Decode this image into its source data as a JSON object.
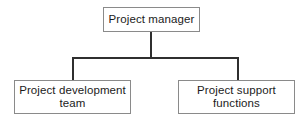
{
  "diagram": {
    "type": "org-chart",
    "orientation": "top-down",
    "background_color": "#ffffff",
    "box_border_color": "#8a8a8a",
    "connector_color": "#2f2f2f",
    "text_color": "#1b1b1b",
    "nodes": [
      {
        "id": "root",
        "label": "Project manager",
        "level": 0
      },
      {
        "id": "dev",
        "label": "Project development\nteam",
        "level": 1
      },
      {
        "id": "support",
        "label": "Project support\nfunctions",
        "level": 1
      }
    ],
    "edges": [
      {
        "from": "root",
        "to": "dev"
      },
      {
        "from": "root",
        "to": "support"
      }
    ]
  }
}
